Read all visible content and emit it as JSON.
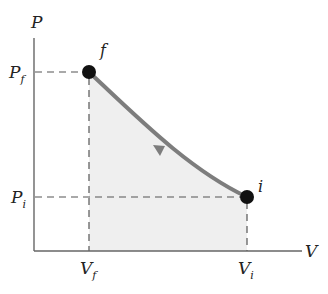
{
  "diagram": {
    "type": "pv-diagram",
    "axes": {
      "y_label": "P",
      "x_label": "V"
    },
    "points": {
      "final": {
        "label": "f",
        "pressure_label": "P",
        "pressure_sub": "f",
        "volume_label": "V",
        "volume_sub": "f"
      },
      "initial": {
        "label": "i",
        "pressure_label": "P",
        "pressure_sub": "i",
        "volume_label": "V",
        "volume_sub": "i"
      }
    },
    "process_direction": "i to f (compression)",
    "colors": {
      "axis": "#666666",
      "curve": "#7d7d7d",
      "area_fill": "#efefef",
      "dash": "#555555",
      "point": "#111111"
    }
  }
}
